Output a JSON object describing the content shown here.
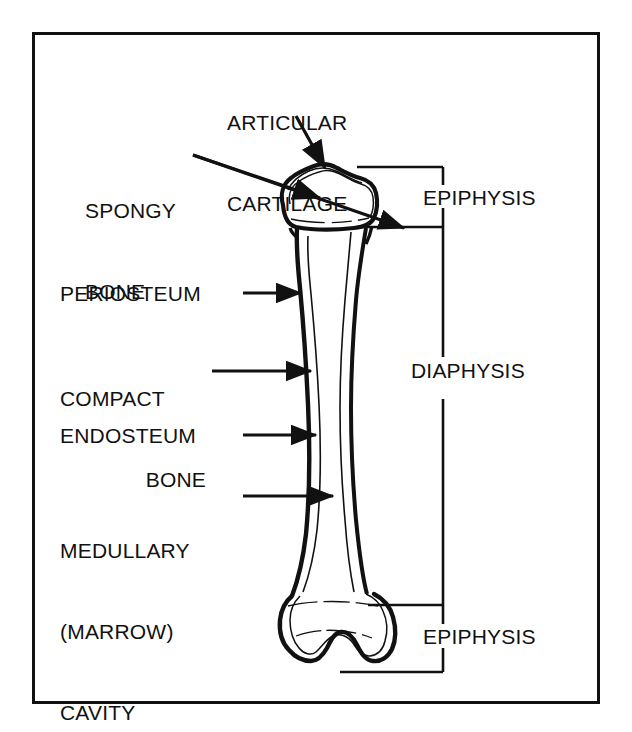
{
  "figure": {
    "frame_color": "#111111",
    "line_color": "#111111",
    "background": "#ffffff"
  },
  "labels": {
    "articular_cartilage": {
      "name": "articular-cartilage-label",
      "line1": "ARTICULAR",
      "line2": "CARTILAGE"
    },
    "spongy_bone": {
      "name": "spongy-bone-label",
      "line1": "SPONGY",
      "line2": "BONE"
    },
    "periosteum": {
      "name": "periosteum-label",
      "text": "PERIOSTEUM"
    },
    "compact_bone": {
      "name": "compact-bone-label",
      "line1": "COMPACT",
      "line2": "BONE"
    },
    "endosteum": {
      "name": "endosteum-label",
      "text": "ENDOSTEUM"
    },
    "medullary_cavity": {
      "name": "medullary-cavity-label",
      "line1": "MEDULLARY",
      "line2": "(MARROW)",
      "line3": "CAVITY"
    },
    "epiphysis_proximal": {
      "name": "epiphysis-proximal-label",
      "text": "EPIPHYSIS"
    },
    "diaphysis": {
      "name": "diaphysis-label",
      "text": "DIAPHYSIS"
    },
    "epiphysis_distal": {
      "name": "epiphysis-distal-label",
      "text": "EPIPHYSIS"
    }
  },
  "structures": [
    {
      "key": "articular_cartilage",
      "label": "ARTICULAR CARTILAGE",
      "pointer": "arrow"
    },
    {
      "key": "spongy_bone",
      "label": "SPONGY BONE",
      "pointer": "arrow"
    },
    {
      "key": "periosteum",
      "label": "PERIOSTEUM",
      "pointer": "arrow"
    },
    {
      "key": "compact_bone",
      "label": "COMPACT BONE",
      "pointer": "arrow"
    },
    {
      "key": "endosteum",
      "label": "ENDOSTEUM",
      "pointer": "arrow"
    },
    {
      "key": "medullary_cavity",
      "label": "MEDULLARY (MARROW) CAVITY",
      "pointer": "arrow"
    },
    {
      "key": "epiphysis_proximal",
      "label": "EPIPHYSIS",
      "pointer": "bracket"
    },
    {
      "key": "diaphysis",
      "label": "DIAPHYSIS",
      "pointer": "bracket"
    },
    {
      "key": "epiphysis_distal",
      "label": "EPIPHYSIS",
      "pointer": "bracket"
    }
  ]
}
